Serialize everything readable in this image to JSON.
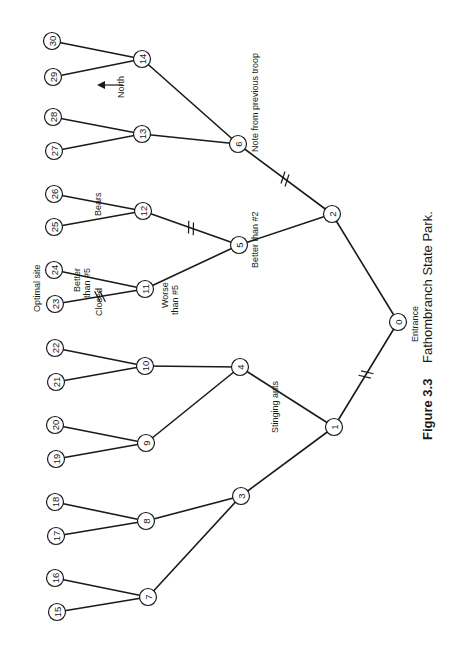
{
  "figure": {
    "caption_number": "Figure 3.3",
    "caption_title": "Fathombranch State Park.",
    "orientation": "rotated 90° counter-clockwise"
  },
  "compass": {
    "label": "North"
  },
  "nodes": [
    {
      "id": "0",
      "x": 398,
      "y": 322
    },
    {
      "id": "1",
      "x": 334,
      "y": 427
    },
    {
      "id": "2",
      "x": 332,
      "y": 214
    },
    {
      "id": "3",
      "x": 241,
      "y": 496
    },
    {
      "id": "4",
      "x": 240,
      "y": 367
    },
    {
      "id": "5",
      "x": 239,
      "y": 245
    },
    {
      "id": "6",
      "x": 238,
      "y": 144
    },
    {
      "id": "7",
      "x": 148,
      "y": 597
    },
    {
      "id": "8",
      "x": 146,
      "y": 521
    },
    {
      "id": "9",
      "x": 146,
      "y": 443
    },
    {
      "id": "10",
      "x": 145,
      "y": 366
    },
    {
      "id": "11",
      "x": 145,
      "y": 289
    },
    {
      "id": "12",
      "x": 143,
      "y": 211
    },
    {
      "id": "13",
      "x": 142,
      "y": 134
    },
    {
      "id": "14",
      "x": 142,
      "y": 59
    },
    {
      "id": "15",
      "x": 57,
      "y": 612
    },
    {
      "id": "16",
      "x": 55,
      "y": 578
    },
    {
      "id": "17",
      "x": 56,
      "y": 536
    },
    {
      "id": "18",
      "x": 55,
      "y": 502
    },
    {
      "id": "19",
      "x": 56,
      "y": 459
    },
    {
      "id": "20",
      "x": 55,
      "y": 425
    },
    {
      "id": "21",
      "x": 56,
      "y": 382
    },
    {
      "id": "22",
      "x": 55,
      "y": 348
    },
    {
      "id": "23",
      "x": 55,
      "y": 304
    },
    {
      "id": "24",
      "x": 54,
      "y": 270
    },
    {
      "id": "25",
      "x": 54,
      "y": 227
    },
    {
      "id": "26",
      "x": 54,
      "y": 194
    },
    {
      "id": "27",
      "x": 54,
      "y": 151
    },
    {
      "id": "28",
      "x": 53,
      "y": 117
    },
    {
      "id": "29",
      "x": 53,
      "y": 77
    },
    {
      "id": "30",
      "x": 52,
      "y": 41
    }
  ],
  "edges": [
    {
      "from": "0",
      "to": "1",
      "blocked": true
    },
    {
      "from": "0",
      "to": "2",
      "blocked": false
    },
    {
      "from": "1",
      "to": "3",
      "blocked": false
    },
    {
      "from": "1",
      "to": "4",
      "blocked": false
    },
    {
      "from": "2",
      "to": "5",
      "blocked": false
    },
    {
      "from": "2",
      "to": "6",
      "blocked": true
    },
    {
      "from": "3",
      "to": "7",
      "blocked": false
    },
    {
      "from": "3",
      "to": "8",
      "blocked": false
    },
    {
      "from": "4",
      "to": "9",
      "blocked": false
    },
    {
      "from": "4",
      "to": "10",
      "blocked": false
    },
    {
      "from": "5",
      "to": "11",
      "blocked": false
    },
    {
      "from": "5",
      "to": "12",
      "blocked": true
    },
    {
      "from": "6",
      "to": "13",
      "blocked": false
    },
    {
      "from": "6",
      "to": "14",
      "blocked": false
    },
    {
      "from": "7",
      "to": "15",
      "blocked": false
    },
    {
      "from": "7",
      "to": "16",
      "blocked": false
    },
    {
      "from": "8",
      "to": "17",
      "blocked": false
    },
    {
      "from": "8",
      "to": "18",
      "blocked": false
    },
    {
      "from": "9",
      "to": "19",
      "blocked": false
    },
    {
      "from": "9",
      "to": "20",
      "blocked": false
    },
    {
      "from": "10",
      "to": "21",
      "blocked": false
    },
    {
      "from": "10",
      "to": "22",
      "blocked": false
    },
    {
      "from": "11",
      "to": "23",
      "blocked": true
    },
    {
      "from": "11",
      "to": "24",
      "blocked": false
    },
    {
      "from": "12",
      "to": "25",
      "blocked": false
    },
    {
      "from": "12",
      "to": "26",
      "blocked": false
    },
    {
      "from": "13",
      "to": "27",
      "blocked": false
    },
    {
      "from": "13",
      "to": "28",
      "blocked": false
    },
    {
      "from": "14",
      "to": "29",
      "blocked": false
    },
    {
      "from": "14",
      "to": "30",
      "blocked": false
    }
  ],
  "annotations": {
    "entrance": "Entrance",
    "stinging_ants": "Stinging ants",
    "better_than_2": "Better than #2",
    "note_prev_troop": "Note from previous troop",
    "bears": "Bears",
    "better_than_5_line1": "Better",
    "better_than_5_line2": "than #5",
    "worse_than_5_line1": "Worse",
    "worse_than_5_line2": "than #5",
    "closed": "Closed",
    "optimal_site": "Optimal site"
  }
}
